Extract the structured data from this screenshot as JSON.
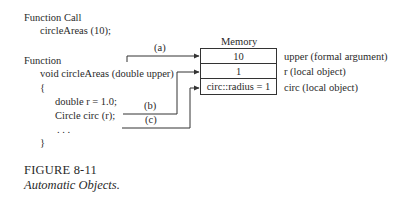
{
  "code": {
    "call_label": "Function Call",
    "call_stmt": "circleAreas (10);",
    "func_label": "Function",
    "signature": "void circleAreas (double upper)",
    "open_brace": "{",
    "line1": "double r = 1.0;",
    "line2": "Circle circ (r);",
    "ellipsis": ". . .",
    "close_brace": "}"
  },
  "arrows": {
    "a": "(a)",
    "b": "(b)",
    "c": "(c)"
  },
  "memory": {
    "title": "Memory",
    "cells": [
      {
        "value": "10",
        "label": "upper (formal argument)"
      },
      {
        "value": "1",
        "label": "r (local object)"
      },
      {
        "value": "circ::radius = 1",
        "label": "circ (local object)"
      }
    ]
  },
  "caption": {
    "number": "FIGURE 8-11",
    "title": "Automatic Objects."
  }
}
